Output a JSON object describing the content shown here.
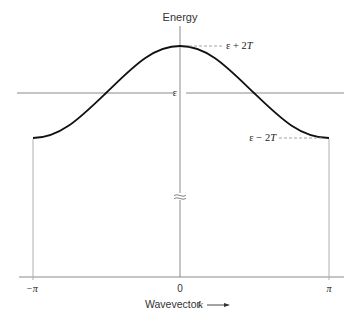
{
  "diagram": {
    "y_axis_label": "Energy",
    "x_axis_label": "Wavevector",
    "x_axis_symbol": "k",
    "x_ticks": [
      {
        "label": "−π",
        "value": "-pi"
      },
      {
        "label": "0",
        "value": "0"
      },
      {
        "label": "π",
        "value": "pi"
      }
    ],
    "levels": {
      "top": {
        "label_prefix": "ε + 2",
        "label_var": "T"
      },
      "middle": {
        "label": "ε"
      },
      "bottom": {
        "label_prefix": "ε − 2",
        "label_var": "T"
      }
    },
    "curve": {
      "equation": "E = ε + 2T cos k",
      "color": "#111111"
    },
    "axis_break_marker": "≈",
    "colors": {
      "axis": "#8a8a8a",
      "curve": "#111111",
      "dashed": "#9a9a9a",
      "text": "#333333"
    }
  }
}
